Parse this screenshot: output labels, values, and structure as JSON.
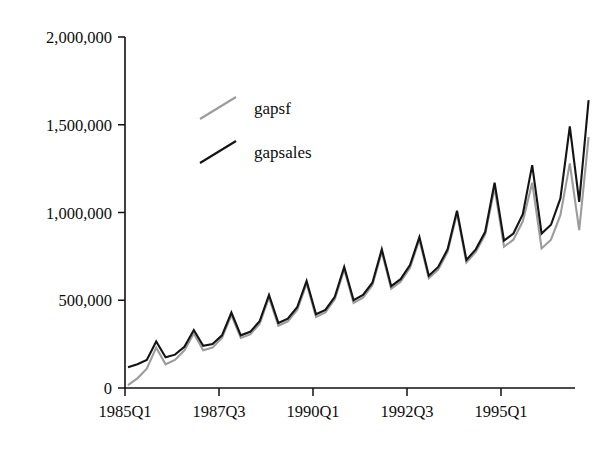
{
  "chart_data": {
    "type": "line",
    "title": "",
    "subtitle": "",
    "xlabel": "",
    "ylabel": "",
    "grid": false,
    "legend_position": "upper-left-inside",
    "ylim": [
      0,
      2000000
    ],
    "yticks": [
      0,
      500000,
      1000000,
      1500000,
      2000000
    ],
    "ytick_labels": [
      "0",
      "500,000",
      "1,000,000",
      "1,500,000",
      "2,000,000"
    ],
    "xticks": [
      "1985Q1",
      "1987Q3",
      "1990Q1",
      "1992Q3",
      "1995Q1"
    ],
    "xtick_labels": [
      "1985Q1",
      "1987Q3",
      "1990Q1",
      "1992Q3",
      "1995Q1"
    ],
    "x": [
      "1985Q1",
      "1985Q2",
      "1985Q3",
      "1985Q4",
      "1986Q1",
      "1986Q2",
      "1986Q3",
      "1986Q4",
      "1987Q1",
      "1987Q2",
      "1987Q3",
      "1987Q4",
      "1988Q1",
      "1988Q2",
      "1988Q3",
      "1988Q4",
      "1989Q1",
      "1989Q2",
      "1989Q3",
      "1989Q4",
      "1990Q1",
      "1990Q2",
      "1990Q3",
      "1990Q4",
      "1991Q1",
      "1991Q2",
      "1991Q3",
      "1991Q4",
      "1992Q1",
      "1992Q2",
      "1992Q3",
      "1992Q4",
      "1993Q1",
      "1993Q2",
      "1993Q3",
      "1993Q4",
      "1994Q1",
      "1994Q2",
      "1994Q3",
      "1994Q4",
      "1995Q1",
      "1995Q2",
      "1995Q3",
      "1995Q4",
      "1996Q1",
      "1996Q2",
      "1996Q3",
      "1996Q4",
      "1997Q1",
      "1997Q2"
    ],
    "series": [
      {
        "name": "gapsales",
        "color": "#141414",
        "linewidth": 2.1,
        "values": [
          118000,
          135000,
          160000,
          265000,
          175000,
          190000,
          235000,
          330000,
          240000,
          250000,
          300000,
          430000,
          300000,
          320000,
          380000,
          530000,
          370000,
          395000,
          460000,
          610000,
          420000,
          445000,
          520000,
          690000,
          500000,
          530000,
          600000,
          790000,
          580000,
          620000,
          700000,
          860000,
          640000,
          690000,
          790000,
          1010000,
          730000,
          790000,
          890000,
          1170000,
          840000,
          880000,
          990000,
          1270000,
          880000,
          930000,
          1080000,
          1490000,
          1060000,
          1640000
        ]
      },
      {
        "name": "gapsf",
        "color": "#9c9c9c",
        "linewidth": 2.1,
        "values": [
          17000,
          55000,
          110000,
          230000,
          135000,
          160000,
          215000,
          310000,
          215000,
          230000,
          285000,
          415000,
          285000,
          305000,
          365000,
          515000,
          355000,
          380000,
          445000,
          595000,
          405000,
          430000,
          505000,
          675000,
          485000,
          515000,
          585000,
          775000,
          565000,
          605000,
          685000,
          845000,
          625000,
          675000,
          775000,
          995000,
          715000,
          775000,
          875000,
          1140000,
          805000,
          845000,
          950000,
          1170000,
          795000,
          845000,
          985000,
          1280000,
          900000,
          1430000
        ]
      }
    ]
  },
  "legend": {
    "entries": [
      {
        "label": "gapsf",
        "color": "#9c9c9c",
        "swatch": "line-swatch"
      },
      {
        "label": "gapsales",
        "color": "#141414",
        "swatch": "line-swatch"
      }
    ]
  },
  "axes": {
    "y_axis_name": "y-axis",
    "x_axis_name": "x-axis"
  }
}
